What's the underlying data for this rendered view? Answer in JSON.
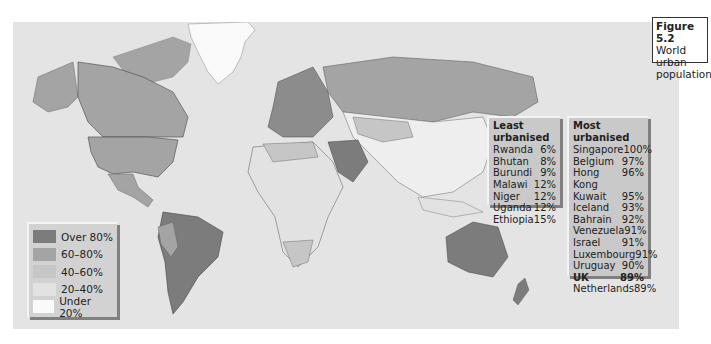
{
  "figure": {
    "number": "Figure 5.2",
    "title_line1": "World urban",
    "title_line2": "population"
  },
  "legend": {
    "items": [
      {
        "label": "Over 80%",
        "color": "#7c7c7c"
      },
      {
        "label": "60–80%",
        "color": "#a4a4a4"
      },
      {
        "label": "40–60%",
        "color": "#c6c6c6"
      },
      {
        "label": "20–40%",
        "color": "#e2e2e2"
      },
      {
        "label": "Under 20%",
        "color": "#fafafa"
      }
    ]
  },
  "least_urbanised": {
    "heading": "Least urbanised",
    "rows": [
      {
        "country": "Rwanda",
        "value": "6%"
      },
      {
        "country": "Bhutan",
        "value": "8%"
      },
      {
        "country": "Burundi",
        "value": "9%"
      },
      {
        "country": "Malawi",
        "value": "12%"
      },
      {
        "country": "Niger",
        "value": "12%"
      },
      {
        "country": "Uganda",
        "value": "12%"
      },
      {
        "country": "Ethiopia",
        "value": "15%"
      }
    ]
  },
  "most_urbanised": {
    "heading": "Most urbanised",
    "rows": [
      {
        "country": "Singapore",
        "value": "100%"
      },
      {
        "country": "Belgium",
        "value": "97%"
      },
      {
        "country": "Hong Kong",
        "value": "96%"
      },
      {
        "country": "Kuwait",
        "value": "95%"
      },
      {
        "country": "Iceland",
        "value": "93%"
      },
      {
        "country": "Bahrain",
        "value": "92%"
      },
      {
        "country": "Venezuela",
        "value": "91%"
      },
      {
        "country": "Israel",
        "value": "91%"
      },
      {
        "country": "Luxembourg",
        "value": "91%"
      },
      {
        "country": "Uruguay",
        "value": "90%"
      },
      {
        "country": "UK",
        "value": "89%",
        "bold": true
      },
      {
        "country": "Netherlands",
        "value": "89%"
      }
    ]
  },
  "map": {
    "ocean_color": "#e4e4e4",
    "regions": {
      "north_america": "#a4a4a4",
      "greenland": "#fafafa",
      "south_america": "#7c7c7c",
      "europe": "#8c8c8c",
      "russia": "#a4a4a4",
      "africa": "#e2e2e2",
      "middle_east": "#7c7c7c",
      "asia": "#eeeeee",
      "australia": "#7c7c7c"
    }
  }
}
